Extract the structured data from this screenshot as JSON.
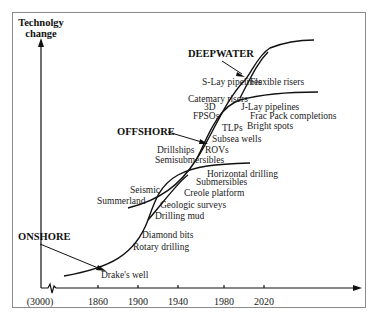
{
  "diagram": {
    "y_axis_label_line1": "Technolgy",
    "y_axis_label_line2": "change",
    "x_ticks": [
      "(3000)",
      "1860",
      "1900",
      "1940",
      "1980",
      "2020"
    ],
    "eras": {
      "onshore": "ONSHORE",
      "offshore": "OFFSHORE",
      "deepwater": "DEEPWATER"
    },
    "onshore_items": [
      "Drake's well",
      "Rotary drilling",
      "Diamond bits",
      "Drilling mud",
      "Geologic surveys",
      "Seismic",
      "Summerland"
    ],
    "offshore_items": [
      "Creole platform",
      "Submersibles",
      "Horizontal drilling",
      "Semisubmersibles",
      "Drillships",
      "ROVs",
      "Subsea wells",
      "TLPs",
      "Bright spots"
    ],
    "deepwater_items": [
      "FPSOs",
      "3D",
      "Catemary risers",
      "J-Lay pipelines",
      "Frac Pack completions",
      "S-Lay pipelines",
      "Flexible risers"
    ],
    "colors": {
      "line": "#111111",
      "border": "#8a8a8a",
      "background": "#ffffff"
    }
  }
}
